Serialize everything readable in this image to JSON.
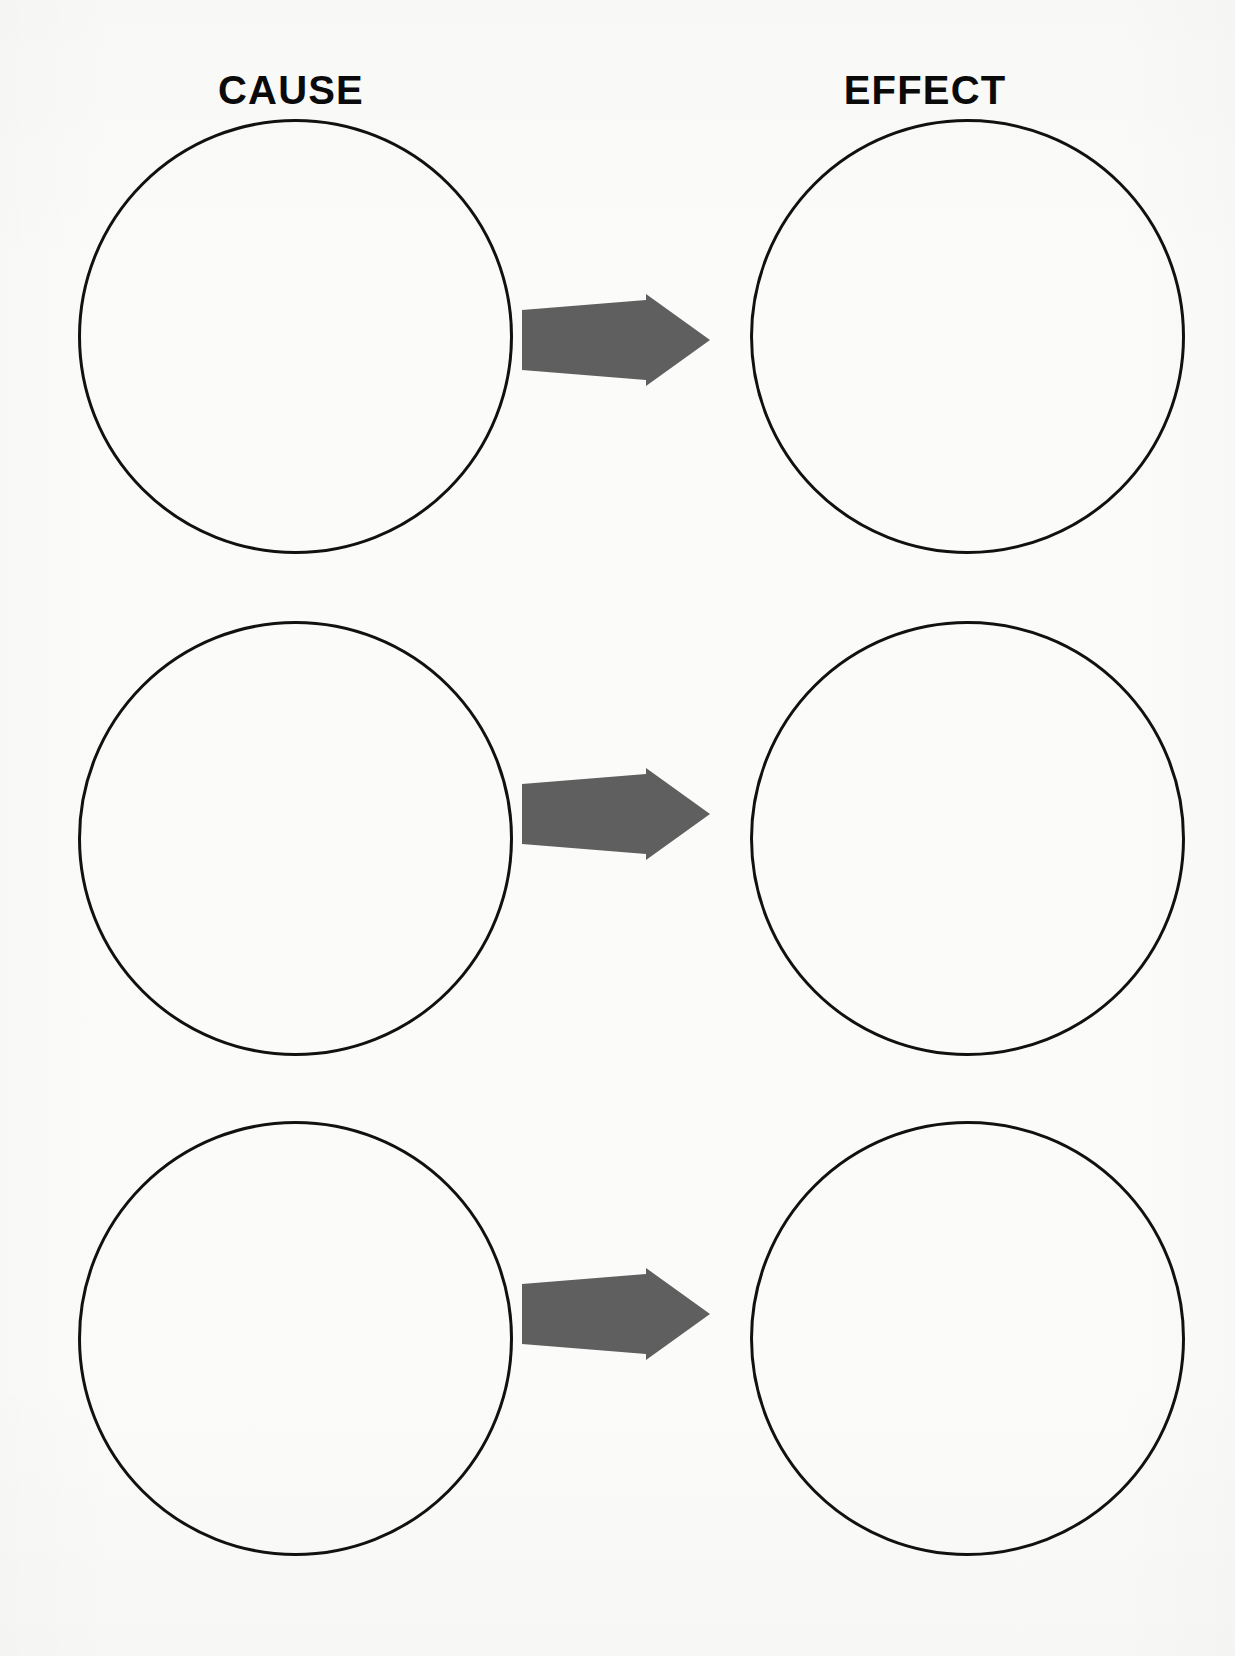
{
  "page": {
    "background_color": "#fbfbfa",
    "width": 1235,
    "height": 1656
  },
  "headings": {
    "left_label": "CAUSE",
    "right_label": "EFFECT",
    "color": "#0a0a0a"
  },
  "style": {
    "circle_stroke_color": "#111111",
    "circle_stroke_width": "3px",
    "circle_fill": "none",
    "arrow_fill_color": "#5f5f5f",
    "arrow_icon_name": "right-arrow-icon"
  },
  "rows": [
    {
      "index": 1,
      "cause_text": "",
      "effect_text": "",
      "arrow_direction": "right",
      "cause_placeholder": "",
      "effect_placeholder": ""
    },
    {
      "index": 2,
      "cause_text": "",
      "effect_text": "",
      "arrow_direction": "right",
      "cause_placeholder": "",
      "effect_placeholder": ""
    },
    {
      "index": 3,
      "cause_text": "",
      "effect_text": "",
      "arrow_direction": "right",
      "cause_placeholder": "",
      "effect_placeholder": ""
    }
  ],
  "geometry": {
    "left_circle_x": 78,
    "right_circle_x": 750,
    "circle_diameter": 435,
    "row_tops": [
      119,
      621,
      1121
    ],
    "arrow_x": 518,
    "arrow_width": 196,
    "arrow_height": 92,
    "arrow_row_tops": [
      294,
      768,
      1268
    ]
  }
}
